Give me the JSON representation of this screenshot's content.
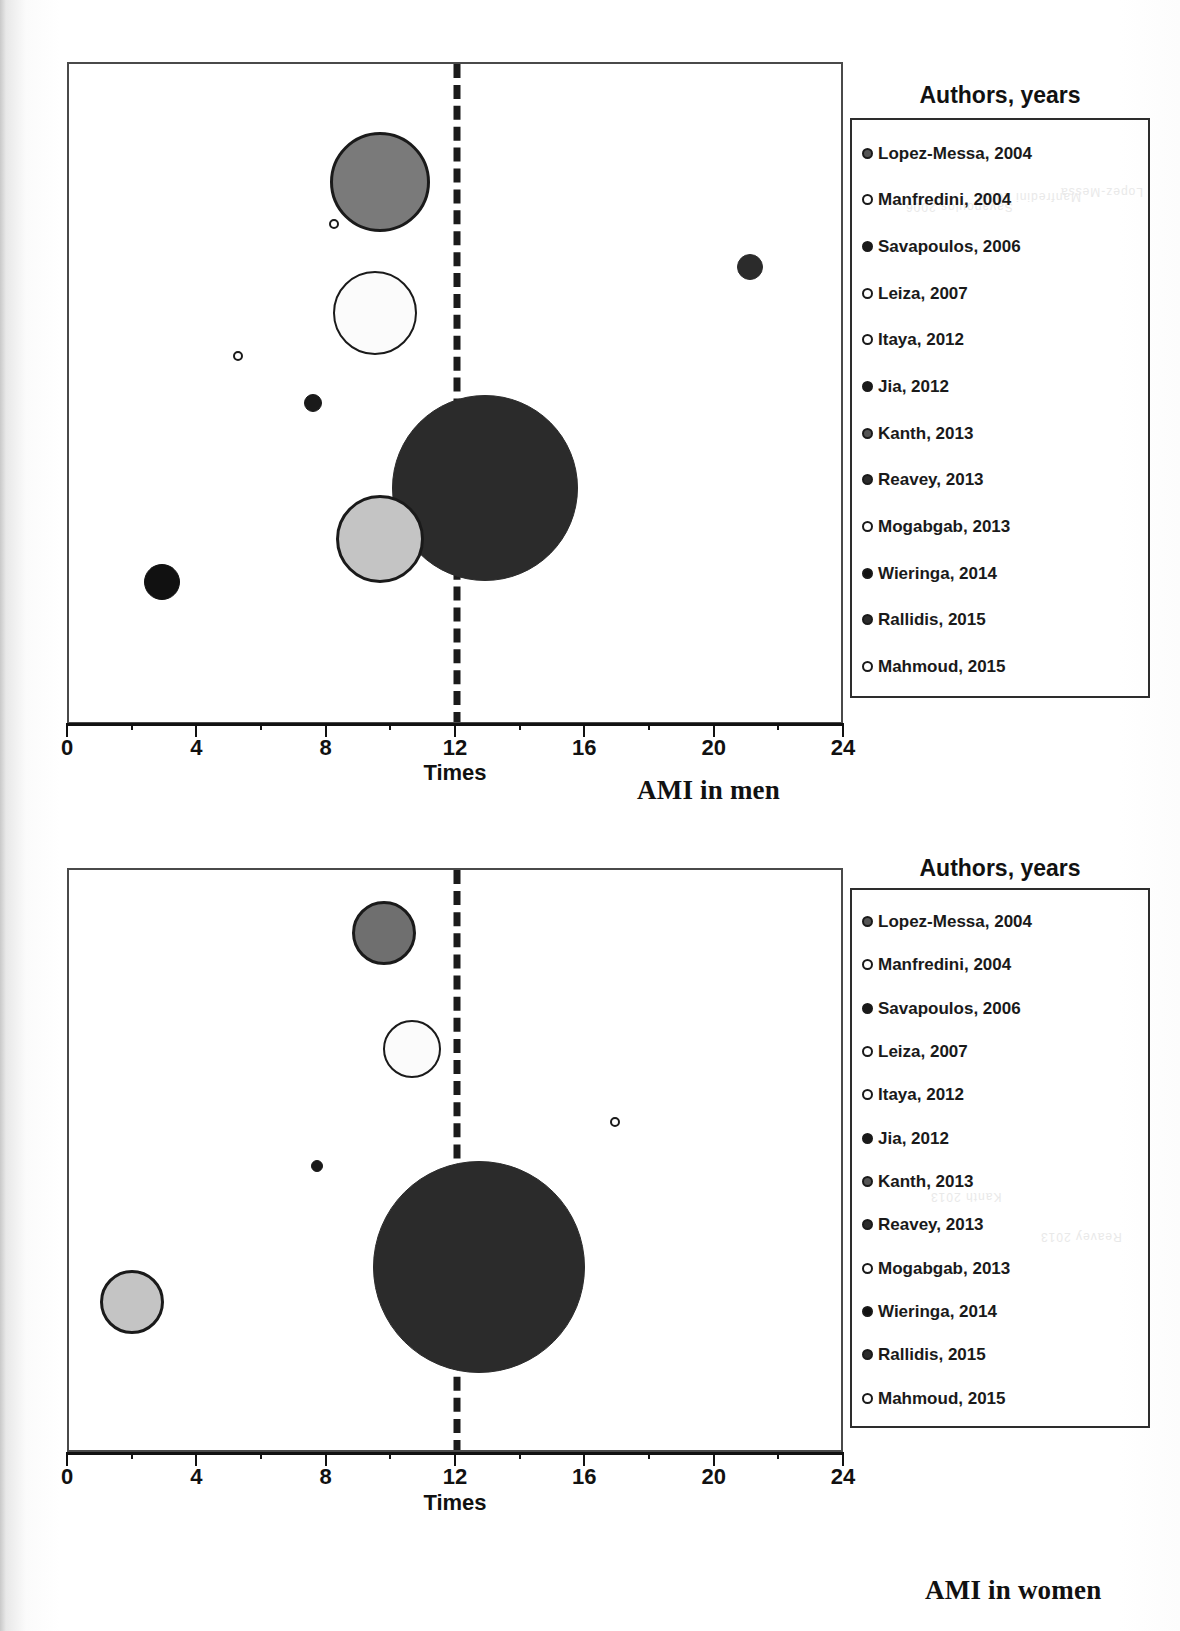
{
  "figure": {
    "panels": [
      {
        "id": "ami-in-men",
        "caption": "AMI in men",
        "legend_title": "Authors, years",
        "axis_title": "Times",
        "tick_labels": [
          "0",
          "4",
          "8",
          "12",
          "16",
          "20",
          "24"
        ]
      },
      {
        "id": "ami-in-women",
        "caption": "AMI in women",
        "legend_title": "Authors, years",
        "axis_title": "Times",
        "tick_labels": [
          "0",
          "4",
          "8",
          "12",
          "16",
          "20",
          "24"
        ]
      }
    ],
    "legend_entries": [
      {
        "label": "Lopez-Messa, 2004",
        "fill": "#7a7a7a"
      },
      {
        "label": "Manfredini, 2004",
        "fill": "#ffffff"
      },
      {
        "label": "Savapoulos, 2006",
        "fill": "#1a1a1a"
      },
      {
        "label": "Leiza, 2007",
        "fill": "#ffffff"
      },
      {
        "label": "Itaya, 2012",
        "fill": "#ffffff"
      },
      {
        "label": "Jia, 2012",
        "fill": "#1a1a1a"
      },
      {
        "label": "Kanth, 2013",
        "fill": "#3f3f3f"
      },
      {
        "label": "Reavey, 2013",
        "fill": "#2b2b2b"
      },
      {
        "label": "Mogabgab, 2013",
        "fill": "#ffffff"
      },
      {
        "label": "Wieringa, 2014",
        "fill": "#111111"
      },
      {
        "label": "Rallidis, 2015",
        "fill": "#2b2b2b"
      },
      {
        "label": "Mahmoud, 2015",
        "fill": "#ffffff"
      }
    ]
  },
  "chart_data": [
    {
      "type": "scatter",
      "title": "AMI in men",
      "xlabel": "Times",
      "ylabel": "",
      "xlim": [
        0,
        24
      ],
      "xticks": [
        0,
        4,
        8,
        12,
        16,
        20,
        24
      ],
      "xminor_step": 2,
      "grid": false,
      "legend_position": "right",
      "legend_title": "Authors, years",
      "annotations": [
        {
          "type": "vline",
          "x": 12,
          "style": "dashed"
        }
      ],
      "note": "Bubble area encodes study weight; y position separates the studies, no y axis shown.",
      "points": [
        {
          "label": "Lopez-Messa, 2004",
          "x": 9.6,
          "size": 100,
          "fill": "#7a7a7a",
          "stroke": "#1a1a1a"
        },
        {
          "label": "Manfredini, 2004",
          "x": 8.2,
          "size": 9,
          "fill": "#ffffff",
          "stroke": "#1a1a1a"
        },
        {
          "label": "Leiza, 2007",
          "x": 9.5,
          "size": 84,
          "fill": "#fbfbfb",
          "stroke": "#1a1a1a"
        },
        {
          "label": "Itaya, 2012",
          "x": 5.2,
          "size": 9,
          "fill": "#ffffff",
          "stroke": "#1a1a1a"
        },
        {
          "label": "Jia, 2012",
          "x": 7.6,
          "size": 16,
          "fill": "#1a1a1a",
          "stroke": "#1a1a1a"
        },
        {
          "label": "Kanth, 2013",
          "x": 12.9,
          "size": 186,
          "fill": "#2b2b2b",
          "stroke": "#2b2b2b"
        },
        {
          "label": "Mogabgab, 2013",
          "x": 9.6,
          "size": 88,
          "fill": "#c4c4c4",
          "stroke": "#1a1a1a"
        },
        {
          "label": "Wieringa, 2014",
          "x": 2.9,
          "size": 34,
          "fill": "#111111",
          "stroke": "#111111"
        },
        {
          "label": "Rallidis, 2015",
          "x": 21.1,
          "size": 26,
          "fill": "#2b2b2b",
          "stroke": "#2b2b2b"
        }
      ]
    },
    {
      "type": "scatter",
      "title": "AMI in women",
      "xlabel": "Times",
      "ylabel": "",
      "xlim": [
        0,
        24
      ],
      "xticks": [
        0,
        4,
        8,
        12,
        16,
        20,
        24
      ],
      "xminor_step": 2,
      "grid": false,
      "legend_position": "right",
      "legend_title": "Authors, years",
      "annotations": [
        {
          "type": "vline",
          "x": 12,
          "style": "dashed"
        }
      ],
      "note": "Bubble area encodes study weight; y position separates the studies, no y axis shown.",
      "points": [
        {
          "label": "Lopez-Messa, 2004",
          "x": 9.7,
          "size": 64,
          "fill": "#6f6f6f",
          "stroke": "#1a1a1a"
        },
        {
          "label": "Leiza, 2007",
          "x": 10.6,
          "size": 58,
          "fill": "#fbfbfb",
          "stroke": "#1a1a1a"
        },
        {
          "label": "Itaya, 2012",
          "x": 16.9,
          "size": 9,
          "fill": "#ffffff",
          "stroke": "#1a1a1a"
        },
        {
          "label": "Jia, 2012",
          "x": 7.7,
          "size": 12,
          "fill": "#1a1a1a",
          "stroke": "#1a1a1a"
        },
        {
          "label": "Kanth, 2013",
          "x": 12.7,
          "size": 210,
          "fill": "#2b2b2b",
          "stroke": "#2b2b2b"
        },
        {
          "label": "Mogabgab, 2013",
          "x": 2.0,
          "size": 64,
          "fill": "#c4c4c4",
          "stroke": "#1a1a1a"
        }
      ]
    }
  ],
  "layout": {
    "panels": [
      {
        "plot": {
          "left": 67,
          "top": 62,
          "width": 776,
          "height": 662
        },
        "axis": {
          "y": 723,
          "x0": 67,
          "x1": 843
        },
        "tick_label_y": 735,
        "axis_title": {
          "x": 455,
          "y": 760
        },
        "caption": {
          "x": 637,
          "y": 775
        },
        "legend_title": {
          "x": 1000,
          "y": 82
        },
        "legend_box": {
          "left": 850,
          "top": 118,
          "width": 300,
          "height": 580
        }
      },
      {
        "plot": {
          "left": 67,
          "top": 868,
          "width": 776,
          "height": 584
        },
        "axis": {
          "y": 1452,
          "x0": 67,
          "x1": 843
        },
        "tick_label_y": 1464,
        "axis_title": {
          "x": 455,
          "y": 1490
        },
        "caption": {
          "x": 925,
          "y": 1575
        },
        "legend_title": {
          "x": 1000,
          "y": 855
        },
        "legend_box": {
          "left": 850,
          "top": 888,
          "width": 300,
          "height": 540
        }
      }
    ],
    "bubbles": [
      [
        {
          "cx": 378,
          "cy": 180,
          "r": 50,
          "fill": "#7a7a7a",
          "stroke": "#1a1a1a",
          "sw": 3
        },
        {
          "cx": 332,
          "cy": 222,
          "r": 5,
          "fill": "#ffffff",
          "stroke": "#1a1a1a",
          "sw": 2
        },
        {
          "cx": 373,
          "cy": 311,
          "r": 42,
          "fill": "#fbfbfb",
          "stroke": "#1a1a1a",
          "sw": 2
        },
        {
          "cx": 236,
          "cy": 354,
          "r": 5,
          "fill": "#ffffff",
          "stroke": "#1a1a1a",
          "sw": 2
        },
        {
          "cx": 311,
          "cy": 401,
          "r": 9,
          "fill": "#1a1a1a",
          "stroke": "#1a1a1a",
          "sw": 1
        },
        {
          "cx": 483,
          "cy": 486,
          "r": 93,
          "fill": "#2b2b2b",
          "stroke": "#2b2b2b",
          "sw": 1
        },
        {
          "cx": 378,
          "cy": 537,
          "r": 44,
          "fill": "#c4c4c4",
          "stroke": "#1a1a1a",
          "sw": 3
        },
        {
          "cx": 160,
          "cy": 580,
          "r": 18,
          "fill": "#111111",
          "stroke": "#111111",
          "sw": 1
        },
        {
          "cx": 748,
          "cy": 265,
          "r": 13,
          "fill": "#2b2b2b",
          "stroke": "#2b2b2b",
          "sw": 1
        }
      ],
      [
        {
          "cx": 382,
          "cy": 931,
          "r": 32,
          "fill": "#6f6f6f",
          "stroke": "#1a1a1a",
          "sw": 3
        },
        {
          "cx": 410,
          "cy": 1047,
          "r": 29,
          "fill": "#fbfbfb",
          "stroke": "#1a1a1a",
          "sw": 2
        },
        {
          "cx": 613,
          "cy": 1120,
          "r": 5,
          "fill": "#ffffff",
          "stroke": "#1a1a1a",
          "sw": 2
        },
        {
          "cx": 315,
          "cy": 1164,
          "r": 6,
          "fill": "#1a1a1a",
          "stroke": "#1a1a1a",
          "sw": 1
        },
        {
          "cx": 477,
          "cy": 1265,
          "r": 106,
          "fill": "#2b2b2b",
          "stroke": "#2b2b2b",
          "sw": 1
        },
        {
          "cx": 130,
          "cy": 1300,
          "r": 32,
          "fill": "#c4c4c4",
          "stroke": "#1a1a1a",
          "sw": 3
        }
      ]
    ],
    "legend_marker_fills": [
      "#555555",
      "#ffffff",
      "#1a1a1a",
      "#ffffff",
      "#ffffff",
      "#1a1a1a",
      "#555555",
      "#2b2b2b",
      "#ffffff",
      "#111111",
      "#2b2b2b",
      "#ffffff"
    ]
  }
}
